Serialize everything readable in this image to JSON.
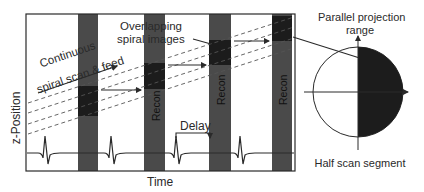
{
  "diagram": {
    "axis_labels": {
      "y": "z-Position",
      "x": "Time"
    },
    "annotations": {
      "continuous_line1": "Continuous",
      "continuous_line2": "spiral scan & feed",
      "overlapping_line1": "Overlapping",
      "overlapping_line2": "spiral images",
      "delay": "Delay"
    },
    "recon_label": "Recon",
    "recon_bars": [
      {
        "x": 78,
        "w": 20,
        "block_top": 86,
        "block_bottom": 116,
        "show_label": false
      },
      {
        "x": 144,
        "w": 21,
        "block_top": 63,
        "block_bottom": 89,
        "show_label": true
      },
      {
        "x": 209,
        "w": 22,
        "block_top": 40,
        "block_bottom": 65,
        "show_label": true
      },
      {
        "x": 272,
        "w": 20,
        "block_top": 16,
        "block_bottom": 41,
        "show_label": true
      }
    ],
    "ecg_peaks_x": [
      45,
      111,
      176,
      240
    ],
    "projection": {
      "title_line1": "Parallel projection",
      "title_line2": "range",
      "caption": "Half scan segment"
    },
    "colors": {
      "bar": "#4a4a4a",
      "block": "#1c1c1c",
      "line": "#2a2a2a",
      "text": "#2a2a2a"
    }
  }
}
